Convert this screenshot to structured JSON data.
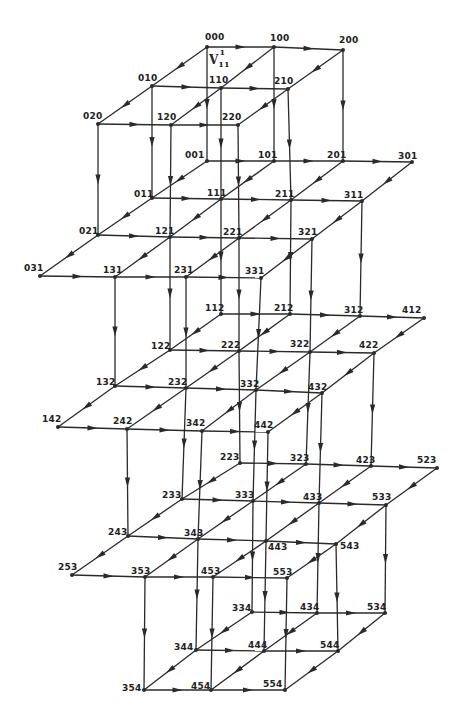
{
  "diagram": {
    "title": "",
    "annotation": {
      "base": "V",
      "sub": "11",
      "sup": "1",
      "x": 209,
      "y": 52
    },
    "nodes": [
      {
        "id": "000",
        "x": 207,
        "y": 47,
        "lx": -2,
        "ly": -14
      },
      {
        "id": "100",
        "x": 274,
        "y": 47,
        "lx": -4,
        "ly": -13
      },
      {
        "id": "200",
        "x": 343,
        "y": 50,
        "lx": -4,
        "ly": -14
      },
      {
        "id": "010",
        "x": 152,
        "y": 86,
        "lx": -14,
        "ly": -12
      },
      {
        "id": "110",
        "x": 221,
        "y": 88,
        "lx": -12,
        "ly": -12
      },
      {
        "id": "210",
        "x": 288,
        "y": 89,
        "lx": -14,
        "ly": -12
      },
      {
        "id": "020",
        "x": 98,
        "y": 124,
        "lx": -15,
        "ly": -12
      },
      {
        "id": "120",
        "x": 171,
        "y": 125,
        "lx": -14,
        "ly": -12
      },
      {
        "id": "220",
        "x": 238,
        "y": 125,
        "lx": -16,
        "ly": -12
      },
      {
        "id": "001",
        "x": 207,
        "y": 161,
        "lx": -22,
        "ly": -10
      },
      {
        "id": "101",
        "x": 274,
        "y": 161,
        "lx": -16,
        "ly": -10
      },
      {
        "id": "201",
        "x": 343,
        "y": 161,
        "lx": -16,
        "ly": -10
      },
      {
        "id": "301",
        "x": 412,
        "y": 162,
        "lx": -14,
        "ly": -10
      },
      {
        "id": "011",
        "x": 152,
        "y": 198,
        "lx": -18,
        "ly": -8
      },
      {
        "id": "111",
        "x": 221,
        "y": 199,
        "lx": -14,
        "ly": -10
      },
      {
        "id": "211",
        "x": 291,
        "y": 200,
        "lx": -16,
        "ly": -10
      },
      {
        "id": "311",
        "x": 362,
        "y": 201,
        "lx": -18,
        "ly": -10
      },
      {
        "id": "021",
        "x": 98,
        "y": 235,
        "lx": -19,
        "ly": -8
      },
      {
        "id": "121",
        "x": 170,
        "y": 237,
        "lx": -15,
        "ly": -10
      },
      {
        "id": "221",
        "x": 239,
        "y": 238,
        "lx": -16,
        "ly": -10
      },
      {
        "id": "321",
        "x": 312,
        "y": 239,
        "lx": -14,
        "ly": -11
      },
      {
        "id": "031",
        "x": 40,
        "y": 276,
        "lx": -16,
        "ly": -12
      },
      {
        "id": "131",
        "x": 115,
        "y": 277,
        "lx": -12,
        "ly": -11
      },
      {
        "id": "231",
        "x": 186,
        "y": 277,
        "lx": -12,
        "ly": -11
      },
      {
        "id": "331",
        "x": 261,
        "y": 278,
        "lx": -16,
        "ly": -11
      },
      {
        "id": "112",
        "x": 221,
        "y": 314,
        "lx": -16,
        "ly": -10
      },
      {
        "id": "212",
        "x": 290,
        "y": 314,
        "lx": -16,
        "ly": -10
      },
      {
        "id": "312",
        "x": 360,
        "y": 316,
        "lx": -16,
        "ly": -10
      },
      {
        "id": "412",
        "x": 424,
        "y": 318,
        "lx": -22,
        "ly": -12
      },
      {
        "id": "122",
        "x": 170,
        "y": 350,
        "lx": -19,
        "ly": -8
      },
      {
        "id": "222",
        "x": 239,
        "y": 351,
        "lx": -18,
        "ly": -10
      },
      {
        "id": "322",
        "x": 310,
        "y": 352,
        "lx": -20,
        "ly": -12
      },
      {
        "id": "422",
        "x": 374,
        "y": 353,
        "lx": -15,
        "ly": -12
      },
      {
        "id": "132",
        "x": 115,
        "y": 386,
        "lx": -19,
        "ly": -8
      },
      {
        "id": "232",
        "x": 186,
        "y": 388,
        "lx": -18,
        "ly": -10
      },
      {
        "id": "332",
        "x": 256,
        "y": 390,
        "lx": -16,
        "ly": -10
      },
      {
        "id": "432",
        "x": 322,
        "y": 393,
        "lx": -14,
        "ly": -10
      },
      {
        "id": "142",
        "x": 58,
        "y": 427,
        "lx": -16,
        "ly": -12
      },
      {
        "id": "242",
        "x": 127,
        "y": 429,
        "lx": -14,
        "ly": -12
      },
      {
        "id": "342",
        "x": 202,
        "y": 431,
        "lx": -16,
        "ly": -12
      },
      {
        "id": "442",
        "x": 268,
        "y": 432,
        "lx": -14,
        "ly": -11
      },
      {
        "id": "223",
        "x": 240,
        "y": 463,
        "lx": -20,
        "ly": -10
      },
      {
        "id": "323",
        "x": 306,
        "y": 464,
        "lx": -16,
        "ly": -10
      },
      {
        "id": "423",
        "x": 371,
        "y": 466,
        "lx": -15,
        "ly": -10
      },
      {
        "id": "523",
        "x": 437,
        "y": 468,
        "lx": -20,
        "ly": -12
      },
      {
        "id": "233",
        "x": 182,
        "y": 499,
        "lx": -20,
        "ly": -8
      },
      {
        "id": "333",
        "x": 253,
        "y": 501,
        "lx": -18,
        "ly": -10
      },
      {
        "id": "433",
        "x": 319,
        "y": 503,
        "lx": -16,
        "ly": -10
      },
      {
        "id": "533",
        "x": 386,
        "y": 505,
        "lx": -14,
        "ly": -12
      },
      {
        "id": "243",
        "x": 128,
        "y": 536,
        "lx": -20,
        "ly": -8
      },
      {
        "id": "343",
        "x": 198,
        "y": 539,
        "lx": -14,
        "ly": -10
      },
      {
        "id": "443",
        "x": 266,
        "y": 541,
        "lx": 2,
        "ly": 2
      },
      {
        "id": "543",
        "x": 336,
        "y": 544,
        "lx": 4,
        "ly": -2
      },
      {
        "id": "253",
        "x": 72,
        "y": 575,
        "lx": -14,
        "ly": -12
      },
      {
        "id": "353",
        "x": 145,
        "y": 577,
        "lx": -14,
        "ly": -10
      },
      {
        "id": "453",
        "x": 213,
        "y": 577,
        "lx": -12,
        "ly": -10
      },
      {
        "id": "553",
        "x": 287,
        "y": 578,
        "lx": -14,
        "ly": -10
      },
      {
        "id": "334",
        "x": 252,
        "y": 612,
        "lx": -20,
        "ly": -8
      },
      {
        "id": "434",
        "x": 317,
        "y": 613,
        "lx": -17,
        "ly": -10
      },
      {
        "id": "534",
        "x": 385,
        "y": 613,
        "lx": -18,
        "ly": -10
      },
      {
        "id": "344",
        "x": 196,
        "y": 650,
        "lx": -22,
        "ly": -7
      },
      {
        "id": "444",
        "x": 264,
        "y": 651,
        "lx": -16,
        "ly": -10
      },
      {
        "id": "544",
        "x": 338,
        "y": 651,
        "lx": -18,
        "ly": -10
      },
      {
        "id": "354",
        "x": 144,
        "y": 690,
        "lx": -22,
        "ly": -6
      },
      {
        "id": "454",
        "x": 211,
        "y": 690,
        "lx": -20,
        "ly": -8
      },
      {
        "id": "554",
        "x": 285,
        "y": 690,
        "lx": -22,
        "ly": -10
      }
    ],
    "edges": [
      [
        "000",
        "100"
      ],
      [
        "100",
        "200"
      ],
      [
        "010",
        "110"
      ],
      [
        "110",
        "210"
      ],
      [
        "020",
        "120"
      ],
      [
        "120",
        "220"
      ],
      [
        "000",
        "010"
      ],
      [
        "010",
        "020"
      ],
      [
        "100",
        "110"
      ],
      [
        "110",
        "120"
      ],
      [
        "200",
        "210"
      ],
      [
        "210",
        "220"
      ],
      [
        "000",
        "001"
      ],
      [
        "100",
        "101"
      ],
      [
        "200",
        "201"
      ],
      [
        "010",
        "011"
      ],
      [
        "110",
        "111"
      ],
      [
        "210",
        "211"
      ],
      [
        "020",
        "021"
      ],
      [
        "120",
        "121"
      ],
      [
        "220",
        "221"
      ],
      [
        "001",
        "101"
      ],
      [
        "101",
        "201"
      ],
      [
        "201",
        "301"
      ],
      [
        "011",
        "111"
      ],
      [
        "111",
        "211"
      ],
      [
        "211",
        "311"
      ],
      [
        "021",
        "121"
      ],
      [
        "121",
        "221"
      ],
      [
        "221",
        "321"
      ],
      [
        "031",
        "131"
      ],
      [
        "131",
        "231"
      ],
      [
        "231",
        "331"
      ],
      [
        "001",
        "011"
      ],
      [
        "011",
        "021"
      ],
      [
        "021",
        "031"
      ],
      [
        "101",
        "111"
      ],
      [
        "111",
        "121"
      ],
      [
        "121",
        "131"
      ],
      [
        "201",
        "211"
      ],
      [
        "211",
        "221"
      ],
      [
        "221",
        "231"
      ],
      [
        "301",
        "311"
      ],
      [
        "311",
        "321"
      ],
      [
        "321",
        "331"
      ],
      [
        "111",
        "112"
      ],
      [
        "211",
        "212"
      ],
      [
        "311",
        "312"
      ],
      [
        "121",
        "122"
      ],
      [
        "221",
        "222"
      ],
      [
        "321",
        "322"
      ],
      [
        "131",
        "132"
      ],
      [
        "231",
        "232"
      ],
      [
        "331",
        "332"
      ],
      [
        "112",
        "212"
      ],
      [
        "212",
        "312"
      ],
      [
        "312",
        "412"
      ],
      [
        "122",
        "222"
      ],
      [
        "222",
        "322"
      ],
      [
        "322",
        "422"
      ],
      [
        "132",
        "232"
      ],
      [
        "232",
        "332"
      ],
      [
        "332",
        "432"
      ],
      [
        "142",
        "242"
      ],
      [
        "242",
        "342"
      ],
      [
        "342",
        "442"
      ],
      [
        "112",
        "122"
      ],
      [
        "122",
        "132"
      ],
      [
        "132",
        "142"
      ],
      [
        "212",
        "222"
      ],
      [
        "222",
        "232"
      ],
      [
        "232",
        "242"
      ],
      [
        "312",
        "322"
      ],
      [
        "322",
        "332"
      ],
      [
        "332",
        "342"
      ],
      [
        "412",
        "422"
      ],
      [
        "422",
        "432"
      ],
      [
        "432",
        "442"
      ],
      [
        "222",
        "223"
      ],
      [
        "322",
        "323"
      ],
      [
        "422",
        "423"
      ],
      [
        "232",
        "233"
      ],
      [
        "332",
        "333"
      ],
      [
        "432",
        "433"
      ],
      [
        "242",
        "243"
      ],
      [
        "342",
        "343"
      ],
      [
        "442",
        "443"
      ],
      [
        "223",
        "323"
      ],
      [
        "323",
        "423"
      ],
      [
        "423",
        "523"
      ],
      [
        "233",
        "333"
      ],
      [
        "333",
        "433"
      ],
      [
        "433",
        "533"
      ],
      [
        "243",
        "343"
      ],
      [
        "343",
        "443"
      ],
      [
        "443",
        "543"
      ],
      [
        "253",
        "353"
      ],
      [
        "353",
        "453"
      ],
      [
        "453",
        "553"
      ],
      [
        "223",
        "233"
      ],
      [
        "233",
        "243"
      ],
      [
        "243",
        "253"
      ],
      [
        "323",
        "333"
      ],
      [
        "333",
        "343"
      ],
      [
        "343",
        "353"
      ],
      [
        "423",
        "433"
      ],
      [
        "433",
        "443"
      ],
      [
        "443",
        "453"
      ],
      [
        "523",
        "533"
      ],
      [
        "533",
        "543"
      ],
      [
        "543",
        "553"
      ],
      [
        "333",
        "334"
      ],
      [
        "433",
        "434"
      ],
      [
        "533",
        "534"
      ],
      [
        "343",
        "344"
      ],
      [
        "443",
        "444"
      ],
      [
        "543",
        "544"
      ],
      [
        "353",
        "354"
      ],
      [
        "453",
        "454"
      ],
      [
        "553",
        "554"
      ],
      [
        "334",
        "434"
      ],
      [
        "434",
        "534"
      ],
      [
        "344",
        "444"
      ],
      [
        "444",
        "544"
      ],
      [
        "354",
        "454"
      ],
      [
        "454",
        "554"
      ],
      [
        "334",
        "344"
      ],
      [
        "344",
        "354"
      ],
      [
        "434",
        "444"
      ],
      [
        "444",
        "454"
      ],
      [
        "534",
        "544"
      ],
      [
        "544",
        "554"
      ]
    ]
  }
}
